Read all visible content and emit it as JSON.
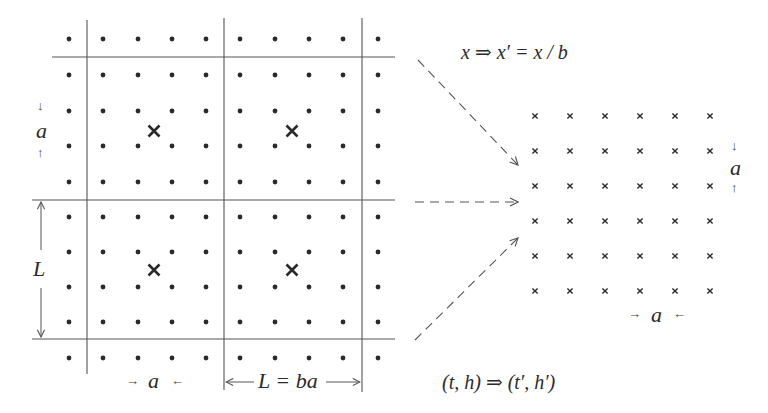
{
  "diagram": {
    "colors": {
      "ink": "#2a2a2a",
      "line": "#555555",
      "dash": "#555555"
    },
    "left_lattice": {
      "dot_columns_x": [
        69,
        103,
        138,
        172,
        206,
        240,
        275,
        309,
        343,
        378
      ],
      "dot_rows_y": [
        39,
        75,
        111,
        146,
        182,
        217,
        252,
        287,
        322,
        358
      ],
      "block_lines_x": [
        87,
        224,
        362
      ],
      "block_lines_y": [
        57,
        200,
        339
      ],
      "block_centers": [
        [
          154,
          131
        ],
        [
          292,
          131
        ],
        [
          154,
          270
        ],
        [
          292,
          270
        ]
      ],
      "label_a_vertical": "a",
      "label_L_vertical": "L",
      "label_a_horizontal": "a",
      "label_L_eq_ba": "L = ba"
    },
    "right_lattice": {
      "cross_columns_x": [
        535,
        570,
        605,
        640,
        675,
        710
      ],
      "cross_rows_y": [
        116,
        151,
        186,
        221,
        256,
        291
      ],
      "label_a_vertical": "a",
      "label_a_horizontal": "a"
    },
    "equations": {
      "coordinate_rescaling": "x  ⇒  x′ =  x / b",
      "parameter_flow": "(t, h)  ⇒  (t′, h′)"
    },
    "mapping_arrows": [
      {
        "from": [
          418,
          60
        ],
        "to": [
          518,
          165
        ]
      },
      {
        "from": [
          415,
          202
        ],
        "to": [
          518,
          202
        ]
      },
      {
        "from": [
          415,
          340
        ],
        "to": [
          518,
          238
        ]
      }
    ],
    "arrow_glyphs": {
      "down": "↓",
      "up": "↑",
      "right": "→",
      "left": "←"
    }
  }
}
